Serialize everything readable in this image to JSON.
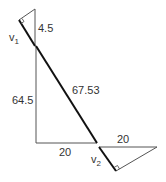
{
  "diagram": {
    "type": "vector triangles",
    "colors": {
      "thin_line": "#555555",
      "thick_line": "#111111",
      "text": "#333333"
    },
    "top_triangle": {
      "side_label": "4.5",
      "vector_label": "v",
      "vector_subscript": "1"
    },
    "main_triangle": {
      "vertical_label": "64.5",
      "hypotenuse_label": "67.53",
      "base_label": "20"
    },
    "bottom_triangle": {
      "top_label": "20",
      "vector_label": "v",
      "vector_subscript": "2"
    }
  }
}
